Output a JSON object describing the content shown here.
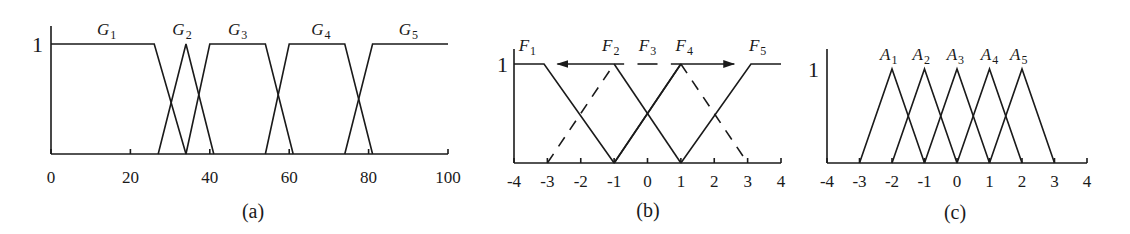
{
  "chart_data": [
    {
      "id": "a",
      "type": "line",
      "caption": "(a)",
      "title": "",
      "xlabel": "",
      "ylabel": "",
      "y_tick_label": "1",
      "xlim": [
        0,
        100
      ],
      "ylim": [
        0,
        1
      ],
      "x_ticks": [
        0,
        20,
        40,
        60,
        80,
        100
      ],
      "x_tick_labels": [
        "0",
        "20",
        "40",
        "60",
        "80",
        "100"
      ],
      "grid": false,
      "series": [
        {
          "name": "G1",
          "label": "G",
          "sub": "1",
          "x": [
            0,
            26,
            34
          ],
          "y": [
            1,
            1,
            0
          ],
          "style": "solid"
        },
        {
          "name": "G2",
          "label": "G",
          "sub": "2",
          "x": [
            27,
            34,
            41
          ],
          "y": [
            0,
            1,
            0
          ],
          "style": "solid"
        },
        {
          "name": "G3",
          "label": "G",
          "sub": "3",
          "x": [
            34,
            40,
            54,
            61
          ],
          "y": [
            0,
            1,
            1,
            0
          ],
          "style": "solid"
        },
        {
          "name": "G4",
          "label": "G",
          "sub": "4",
          "x": [
            54,
            60,
            74,
            81
          ],
          "y": [
            0,
            1,
            1,
            0
          ],
          "style": "solid"
        },
        {
          "name": "G5",
          "label": "G",
          "sub": "5",
          "x": [
            74,
            81,
            100
          ],
          "y": [
            0,
            1,
            1
          ],
          "style": "solid"
        }
      ],
      "label_positions": [
        {
          "text": "G",
          "sub": "1",
          "x": 14,
          "y": 1.08
        },
        {
          "text": "G",
          "sub": "2",
          "x": 33,
          "y": 1.08
        },
        {
          "text": "G",
          "sub": "3",
          "x": 47,
          "y": 1.08
        },
        {
          "text": "G",
          "sub": "4",
          "x": 68,
          "y": 1.08
        },
        {
          "text": "G",
          "sub": "5",
          "x": 90,
          "y": 1.08
        }
      ]
    },
    {
      "id": "b",
      "type": "line",
      "caption": "(b)",
      "title": "",
      "xlabel": "",
      "ylabel": "",
      "y_tick_label": "1",
      "xlim": [
        -4,
        4
      ],
      "ylim": [
        0,
        1
      ],
      "x_ticks": [
        -4,
        -3,
        -2,
        -1,
        0,
        1,
        2,
        3,
        4
      ],
      "x_tick_labels": [
        "-4",
        "-3",
        "-2",
        "-1",
        "0",
        "1",
        "2",
        "3",
        "4"
      ],
      "grid": false,
      "series": [
        {
          "name": "F1",
          "label": "F",
          "sub": "1",
          "x": [
            -4,
            -3.1,
            -1
          ],
          "y": [
            1,
            1,
            0
          ],
          "style": "solid"
        },
        {
          "name": "F2",
          "label": "F",
          "sub": "2",
          "x": [
            -3,
            -1,
            1
          ],
          "y": [
            0,
            1,
            0
          ],
          "style": "dashed-left-solid-right"
        },
        {
          "name": "F3",
          "label": "F",
          "sub": "3",
          "x": [
            -1,
            1
          ],
          "y": [
            0,
            1
          ],
          "style": "solid"
        },
        {
          "name": "F4",
          "label": "F",
          "sub": "4",
          "x": [
            -1,
            1,
            3
          ],
          "y": [
            0,
            1,
            0
          ],
          "style": "solid-left-dashed-right"
        },
        {
          "name": "F5",
          "label": "F",
          "sub": "5",
          "x": [
            1,
            3.1,
            4
          ],
          "y": [
            0,
            1,
            1
          ],
          "style": "solid"
        }
      ],
      "annotations": [
        {
          "type": "arrow",
          "from": [
            -0.7,
            1
          ],
          "to": [
            -2.7,
            1
          ],
          "direction": "left",
          "note": "F2 shifts left"
        },
        {
          "type": "arrow",
          "from": [
            0.7,
            1
          ],
          "to": [
            2.6,
            1
          ],
          "direction": "right",
          "note": "F4 shifts right"
        },
        {
          "type": "segment",
          "from": [
            -0.3,
            1
          ],
          "to": [
            0.3,
            1
          ],
          "note": "F3 plateau marker"
        }
      ],
      "label_positions": [
        {
          "text": "F",
          "sub": "1",
          "x": -3.6,
          "y": 1.13
        },
        {
          "text": "F",
          "sub": "2",
          "x": -1.1,
          "y": 1.13
        },
        {
          "text": "F",
          "sub": "3",
          "x": 0.0,
          "y": 1.13
        },
        {
          "text": "F",
          "sub": "4",
          "x": 1.1,
          "y": 1.13
        },
        {
          "text": "F",
          "sub": "5",
          "x": 3.3,
          "y": 1.13
        }
      ]
    },
    {
      "id": "c",
      "type": "line",
      "caption": "(c)",
      "title": "",
      "xlabel": "",
      "ylabel": "",
      "y_tick_label": "1",
      "xlim": [
        -4,
        4
      ],
      "ylim": [
        0,
        1
      ],
      "x_ticks": [
        -4,
        -3,
        -2,
        -1,
        0,
        1,
        2,
        3,
        4
      ],
      "x_tick_labels": [
        "-4",
        "-3",
        "-2",
        "-1",
        "0",
        "1",
        "2",
        "3",
        "4"
      ],
      "grid": false,
      "series": [
        {
          "name": "A1",
          "label": "A",
          "sub": "1",
          "x": [
            -3,
            -2,
            -1
          ],
          "y": [
            0,
            1,
            0
          ],
          "style": "solid"
        },
        {
          "name": "A2",
          "label": "A",
          "sub": "2",
          "x": [
            -2,
            -1,
            0
          ],
          "y": [
            0,
            1,
            0
          ],
          "style": "solid"
        },
        {
          "name": "A3",
          "label": "A",
          "sub": "3",
          "x": [
            -1,
            0,
            1
          ],
          "y": [
            0,
            1,
            0
          ],
          "style": "solid"
        },
        {
          "name": "A4",
          "label": "A",
          "sub": "4",
          "x": [
            0,
            1,
            2
          ],
          "y": [
            0,
            1,
            0
          ],
          "style": "solid"
        },
        {
          "name": "A5",
          "label": "A",
          "sub": "5",
          "x": [
            1,
            2,
            3
          ],
          "y": [
            0,
            1,
            0
          ],
          "style": "solid"
        }
      ],
      "label_positions": [
        {
          "text": "A",
          "sub": "1",
          "x": -2.1,
          "y": 1.1
        },
        {
          "text": "A",
          "sub": "2",
          "x": -1.1,
          "y": 1.1
        },
        {
          "text": "A",
          "sub": "3",
          "x": -0.05,
          "y": 1.1
        },
        {
          "text": "A",
          "sub": "4",
          "x": 1.0,
          "y": 1.1
        },
        {
          "text": "A",
          "sub": "5",
          "x": 1.9,
          "y": 1.1
        }
      ]
    }
  ],
  "layout": {
    "panels": [
      {
        "id": "a",
        "x0": 51,
        "x1": 448,
        "y0": 154,
        "y1": 44,
        "axis_top": 26,
        "one_x": 32,
        "tick_label_y": 183,
        "caption_x": 253,
        "caption_y": 218
      },
      {
        "id": "b",
        "x0": 514,
        "x1": 781,
        "y0": 163,
        "y1": 64,
        "axis_top": 49,
        "one_x": 497,
        "tick_label_y": 187,
        "caption_x": 648,
        "caption_y": 217
      },
      {
        "id": "c",
        "x0": 827,
        "x1": 1087,
        "y0": 163,
        "y1": 69,
        "axis_top": 49,
        "one_x": 808,
        "tick_label_y": 187,
        "caption_x": 955,
        "caption_y": 219
      }
    ]
  }
}
